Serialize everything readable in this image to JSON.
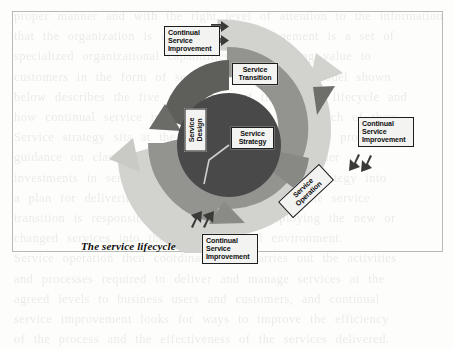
{
  "figure": {
    "caption": "The service lifecycle",
    "title": "The service lifecycle",
    "colors": {
      "outer_ring": "#cfcfcb",
      "middle_ring": "#969692",
      "inner_circle": "#4a4a48",
      "label_fill": "#f3f3f1",
      "label_border": "#1d1d1d",
      "frame_border": "#b9b9b9",
      "page_background": "#fdfdfb",
      "arrow_marker": "#3a3a38"
    },
    "rings": [
      {
        "name": "outer-ring",
        "label": "Continual Service Improvement",
        "tone": "light"
      },
      {
        "name": "middle-ring",
        "label": "Service Transition / Service Design / Service Operation",
        "tone": "medium"
      },
      {
        "name": "inner-circle",
        "label": "Service Strategy",
        "tone": "dark"
      }
    ],
    "stages": [
      {
        "id": "strategy",
        "label_lines": [
          "Service",
          "Strategy"
        ],
        "position": "center",
        "rotation": 0
      },
      {
        "id": "transition",
        "label_lines": [
          "Service",
          "Transition"
        ],
        "position": "top",
        "rotation": 0
      },
      {
        "id": "design",
        "label_lines": [
          "Service",
          "Design"
        ],
        "position": "left",
        "rotation": -90
      },
      {
        "id": "operation",
        "label_lines": [
          "Service",
          "Operation"
        ],
        "position": "bottom-right",
        "rotation": -43
      }
    ],
    "csi_labels": [
      {
        "id": "csi-top",
        "lines": [
          "Continual",
          "Service",
          "Improvement"
        ],
        "arrows": "two-right-arrows",
        "position": "top-left"
      },
      {
        "id": "csi-right",
        "lines": [
          "Continual",
          "Service",
          "Improvement"
        ],
        "arrows": "two-down-left-arrows",
        "position": "right"
      },
      {
        "id": "csi-bottom",
        "lines": [
          "Continual",
          "Service",
          "Improvement"
        ],
        "arrows": "two-up-left-arrows",
        "position": "bottom"
      }
    ]
  },
  "bleed_text": {
    "lines": [
      "proper manner and with the right level of attention to the information",
      "that the organization is using. Service management is a set of",
      "specialized organizational capabilities for providing value to",
      "customers in the form of services. The lifecycle model shown",
      "below describes the five core stages of the service lifecycle and",
      "how continual service improvement applies across each of them.",
      "Service strategy sits at the hub of the lifecycle and provides",
      "guidance on clarifying and prioritizing service-provider",
      "investments in services. Service design turns the strategy into",
      "a plan for delivering the business objectives, while service",
      "transition is responsible for building and deploying the new or",
      "changed services into the live operational environment.",
      "Service operation then coordinates and carries out the activities",
      "and processes required to deliver and manage services at the",
      "agreed levels to business users and customers, and continual",
      "service improvement looks for ways to improve the efficiency",
      "of the process and the effectiveness of the services delivered."
    ]
  }
}
